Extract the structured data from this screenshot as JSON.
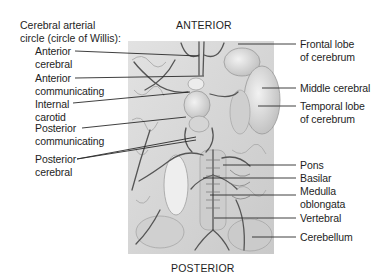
{
  "diagram": {
    "heading": {
      "line1": "Cerebral arterial",
      "line2": "circle (circle of Willis):"
    },
    "orientation": {
      "top": "ANTERIOR",
      "bottom": "POSTERIOR"
    },
    "left_labels": [
      {
        "line1": "Anterior",
        "line2": "cerebral"
      },
      {
        "line1": "Anterior",
        "line2": "communicating"
      },
      {
        "line1": "Internal",
        "line2": "carotid"
      },
      {
        "line1": "Posterior",
        "line2": "communicating"
      },
      {
        "line1": "Posterior",
        "line2": "cerebral"
      }
    ],
    "right_labels": [
      {
        "line1": "Frontal lobe",
        "line2": "of cerebrum"
      },
      {
        "line1": "Middle cerebral",
        "line2": ""
      },
      {
        "line1": "Temporal lobe",
        "line2": "of cerebrum"
      },
      {
        "line1": "Pons",
        "line2": ""
      },
      {
        "line1": "Basilar",
        "line2": ""
      },
      {
        "line1": "Medulla",
        "line2": "oblongata"
      },
      {
        "line1": "Vertebral",
        "line2": ""
      },
      {
        "line1": "Cerebellum",
        "line2": ""
      }
    ],
    "colors": {
      "text": "#1e1e1e",
      "leader_line": "#2a2a2a",
      "illustration_bg": "#d8d8d8",
      "vessel": "#555555"
    }
  }
}
